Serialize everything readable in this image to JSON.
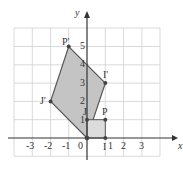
{
  "axes": {
    "x_label": "x",
    "y_label": "y",
    "origin_label": "0"
  },
  "x_ticks": [
    "-3",
    "-2",
    "-1",
    "1",
    "2",
    "3"
  ],
  "y_ticks": [
    "1",
    "2",
    "3",
    "4",
    "5"
  ],
  "points": {
    "P_prime": {
      "label": "P'",
      "x": -1,
      "y": 5
    },
    "I_prime": {
      "label": "I'",
      "x": 1,
      "y": 3
    },
    "J_prime": {
      "label": "J'",
      "x": -2,
      "y": 2
    },
    "J": {
      "label": "J",
      "x": 0,
      "y": 1
    },
    "P": {
      "label": "P",
      "x": 1,
      "y": 1
    },
    "I": {
      "label": "I",
      "x": 1,
      "y": 0
    }
  },
  "colors": {
    "shade": "#c4c4c4",
    "grid": "#c8c8c8",
    "line": "#555555"
  }
}
